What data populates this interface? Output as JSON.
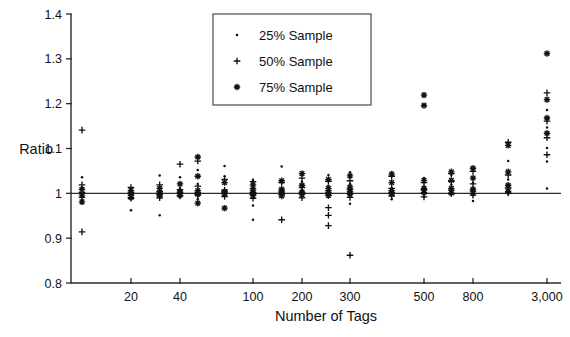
{
  "chart_data": {
    "type": "scatter",
    "title": "",
    "xlabel": "Number of Tags",
    "ylabel": "Ratio",
    "grid": false,
    "legend_position": "top-center",
    "ylim": [
      0.8,
      1.4
    ],
    "ytick_labels": [
      "1.4",
      "1.3",
      "1.2",
      "1.1",
      "1",
      "0.9",
      "0.8"
    ],
    "ytick_values": [
      1.4,
      1.3,
      1.2,
      1.1,
      1.0,
      0.9,
      0.8
    ],
    "xtick_labels": [
      "20",
      "40",
      "100",
      "200",
      "300",
      "500",
      "800",
      "3,000"
    ],
    "xtick_values": [
      20,
      40,
      100,
      200,
      300,
      500,
      800,
      3000
    ],
    "reference_line": {
      "axis": "y",
      "value": 1.0,
      "label": ""
    },
    "legend": [
      {
        "name": "25% Sample",
        "marker": "dot"
      },
      {
        "name": "50% Sample",
        "marker": "plus"
      },
      {
        "name": "75% Sample",
        "marker": "star"
      }
    ],
    "series": [
      {
        "name": "25% Sample",
        "marker": "dot",
        "points": [
          [
            10,
            1.036
          ],
          [
            10,
            0.985
          ],
          [
            10,
            0.978
          ],
          [
            20,
            1.004
          ],
          [
            20,
            0.997
          ],
          [
            20,
            0.962
          ],
          [
            30,
            1.04
          ],
          [
            30,
            1.013
          ],
          [
            30,
            0.998
          ],
          [
            30,
            0.951
          ],
          [
            40,
            1.036
          ],
          [
            40,
            1.011
          ],
          [
            40,
            0.999
          ],
          [
            40,
            0.992
          ],
          [
            50,
            1.052
          ],
          [
            50,
            1.021
          ],
          [
            50,
            1.0
          ],
          [
            50,
            0.987
          ],
          [
            70,
            1.061
          ],
          [
            70,
            1.038
          ],
          [
            70,
            1.004
          ],
          [
            70,
            0.996
          ],
          [
            100,
            1.03
          ],
          [
            100,
            1.013
          ],
          [
            100,
            1.003
          ],
          [
            100,
            0.996
          ],
          [
            100,
            0.973
          ],
          [
            100,
            0.941
          ],
          [
            150,
            1.06
          ],
          [
            150,
            1.024
          ],
          [
            150,
            1.003
          ],
          [
            150,
            0.995
          ],
          [
            200,
            1.046
          ],
          [
            200,
            1.026
          ],
          [
            200,
            1.006
          ],
          [
            200,
            0.998
          ],
          [
            250,
            1.041
          ],
          [
            250,
            1.017
          ],
          [
            250,
            1.003
          ],
          [
            250,
            0.993
          ],
          [
            300,
            1.047
          ],
          [
            300,
            1.021
          ],
          [
            300,
            1.001
          ],
          [
            300,
            0.994
          ],
          [
            300,
            0.977
          ],
          [
            400,
            1.046
          ],
          [
            400,
            1.012
          ],
          [
            400,
            1.001
          ],
          [
            400,
            0.987
          ],
          [
            500,
            1.034
          ],
          [
            500,
            1.014
          ],
          [
            500,
            1.002
          ],
          [
            500,
            0.993
          ],
          [
            650,
            1.041
          ],
          [
            650,
            1.019
          ],
          [
            650,
            1.004
          ],
          [
            650,
            0.998
          ],
          [
            800,
            1.051
          ],
          [
            800,
            1.023
          ],
          [
            800,
            1.007
          ],
          [
            800,
            0.998
          ],
          [
            800,
            0.983
          ],
          [
            1500,
            1.072
          ],
          [
            1500,
            1.031
          ],
          [
            1500,
            1.011
          ],
          [
            1500,
            0.999
          ],
          [
            3000,
            1.186
          ],
          [
            3000,
            1.147
          ],
          [
            3000,
            1.101
          ],
          [
            3000,
            1.071
          ],
          [
            3000,
            1.011
          ]
        ]
      },
      {
        "name": "50% Sample",
        "marker": "plus",
        "points": [
          [
            10,
            1.141
          ],
          [
            10,
            1.019
          ],
          [
            10,
            1.002
          ],
          [
            10,
            0.991
          ],
          [
            10,
            0.914
          ],
          [
            20,
            1.013
          ],
          [
            20,
            1.002
          ],
          [
            20,
            0.996
          ],
          [
            20,
            0.989
          ],
          [
            30,
            1.019
          ],
          [
            30,
            1.004
          ],
          [
            30,
            0.998
          ],
          [
            30,
            0.99
          ],
          [
            40,
            1.065
          ],
          [
            40,
            1.008
          ],
          [
            40,
            1.001
          ],
          [
            40,
            0.994
          ],
          [
            50,
            1.072
          ],
          [
            50,
            1.016
          ],
          [
            50,
            1.002
          ],
          [
            50,
            0.996
          ],
          [
            70,
            1.031
          ],
          [
            70,
            1.007
          ],
          [
            70,
            1.001
          ],
          [
            70,
            0.993
          ],
          [
            100,
            1.026
          ],
          [
            100,
            1.011
          ],
          [
            100,
            1.002
          ],
          [
            100,
            0.997
          ],
          [
            100,
            0.989
          ],
          [
            150,
            1.024
          ],
          [
            150,
            1.005
          ],
          [
            150,
            0.998
          ],
          [
            150,
            0.941
          ],
          [
            200,
            1.034
          ],
          [
            200,
            1.013
          ],
          [
            200,
            1.001
          ],
          [
            200,
            0.99
          ],
          [
            250,
            1.027
          ],
          [
            250,
            1.006
          ],
          [
            250,
            0.996
          ],
          [
            250,
            0.968
          ],
          [
            250,
            0.951
          ],
          [
            250,
            0.928
          ],
          [
            300,
            1.028
          ],
          [
            300,
            1.009
          ],
          [
            300,
            1.0
          ],
          [
            300,
            0.991
          ],
          [
            300,
            0.862
          ],
          [
            400,
            1.038
          ],
          [
            400,
            1.011
          ],
          [
            400,
            1.002
          ],
          [
            400,
            0.994
          ],
          [
            500,
            1.024
          ],
          [
            500,
            1.008
          ],
          [
            500,
            1.0
          ],
          [
            500,
            0.992
          ],
          [
            650,
            1.044
          ],
          [
            650,
            1.027
          ],
          [
            650,
            1.007
          ],
          [
            650,
            0.999
          ],
          [
            800,
            1.049
          ],
          [
            800,
            1.021
          ],
          [
            800,
            1.005
          ],
          [
            800,
            0.996
          ],
          [
            1500,
            1.114
          ],
          [
            1500,
            1.041
          ],
          [
            1500,
            1.012
          ],
          [
            1500,
            1.001
          ],
          [
            3000,
            1.224
          ],
          [
            3000,
            1.161
          ],
          [
            3000,
            1.124
          ],
          [
            3000,
            1.086
          ]
        ]
      },
      {
        "name": "75% Sample",
        "marker": "star",
        "points": [
          [
            10,
            1.009
          ],
          [
            10,
            0.996
          ],
          [
            10,
            0.981
          ],
          [
            20,
            1.006
          ],
          [
            20,
            0.999
          ],
          [
            20,
            0.991
          ],
          [
            30,
            1.011
          ],
          [
            30,
            1.001
          ],
          [
            30,
            0.994
          ],
          [
            40,
            1.021
          ],
          [
            40,
            1.003
          ],
          [
            40,
            0.996
          ],
          [
            50,
            1.081
          ],
          [
            50,
            1.038
          ],
          [
            50,
            1.006
          ],
          [
            50,
            0.998
          ],
          [
            50,
            0.978
          ],
          [
            70,
            1.024
          ],
          [
            70,
            1.004
          ],
          [
            70,
            0.999
          ],
          [
            70,
            0.967
          ],
          [
            100,
            1.019
          ],
          [
            100,
            1.007
          ],
          [
            100,
            1.001
          ],
          [
            100,
            0.996
          ],
          [
            150,
            1.028
          ],
          [
            150,
            1.009
          ],
          [
            150,
            1.002
          ],
          [
            150,
            0.994
          ],
          [
            200,
            1.044
          ],
          [
            200,
            1.018
          ],
          [
            200,
            1.003
          ],
          [
            200,
            0.997
          ],
          [
            250,
            1.031
          ],
          [
            250,
            1.011
          ],
          [
            250,
            1.002
          ],
          [
            250,
            0.995
          ],
          [
            300,
            1.039
          ],
          [
            300,
            1.014
          ],
          [
            300,
            1.004
          ],
          [
            300,
            0.998
          ],
          [
            400,
            1.043
          ],
          [
            400,
            1.024
          ],
          [
            400,
            1.006
          ],
          [
            400,
            0.999
          ],
          [
            500,
            1.219
          ],
          [
            500,
            1.196
          ],
          [
            500,
            1.029
          ],
          [
            500,
            1.011
          ],
          [
            500,
            1.002
          ],
          [
            650,
            1.048
          ],
          [
            650,
            1.029
          ],
          [
            650,
            1.011
          ],
          [
            650,
            1.001
          ],
          [
            800,
            1.056
          ],
          [
            800,
            1.034
          ],
          [
            800,
            1.009
          ],
          [
            800,
            1.0
          ],
          [
            1500,
            1.107
          ],
          [
            1500,
            1.048
          ],
          [
            1500,
            1.018
          ],
          [
            1500,
            1.004
          ],
          [
            3000,
            1.312
          ],
          [
            3000,
            1.209
          ],
          [
            3000,
            1.168
          ],
          [
            3000,
            1.134
          ]
        ]
      }
    ]
  },
  "caption": {
    "partial_text": ""
  }
}
